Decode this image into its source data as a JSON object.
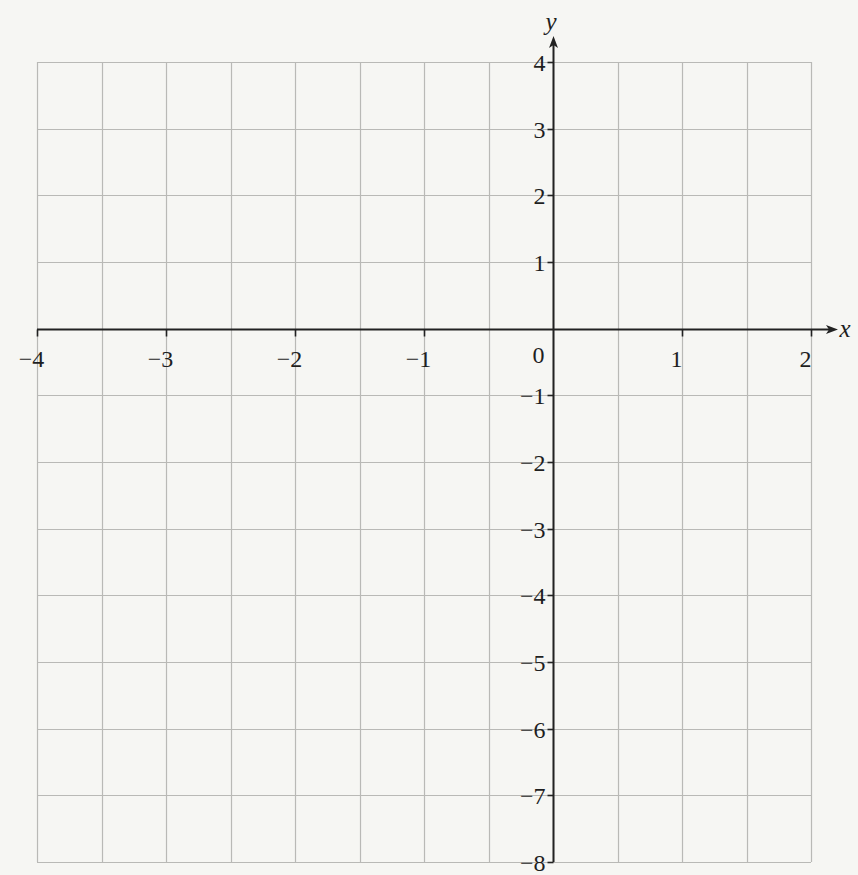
{
  "chart_data": {
    "type": "scatter",
    "title": "",
    "xlabel": "x",
    "ylabel": "y",
    "xlim": [
      -4,
      2
    ],
    "ylim": [
      -8,
      4
    ],
    "x_ticks": [
      -4,
      -3,
      -2,
      -1,
      0,
      1,
      2
    ],
    "y_ticks": [
      4,
      3,
      2,
      1,
      -1,
      -2,
      -3,
      -4,
      -5,
      -6,
      -7,
      -8
    ],
    "x_tick_labels": [
      "−4",
      "−3",
      "−2",
      "−1",
      "0",
      "1",
      "2"
    ],
    "y_tick_labels": [
      "4",
      "3",
      "2",
      "1",
      "−1",
      "−2",
      "−3",
      "−4",
      "−5",
      "−6",
      "−7",
      "−8"
    ],
    "origin_label": "0",
    "grid": {
      "on": true,
      "x_step": 0.5,
      "y_step": 1
    },
    "series": [],
    "legend": null
  },
  "axes": {
    "x_name": "x",
    "y_name": "y",
    "origin": "0"
  },
  "colors": {
    "background": "#f6f6f3",
    "grid": "#b9b9b6",
    "axis": "#222222",
    "text": "#1f1f1f"
  }
}
